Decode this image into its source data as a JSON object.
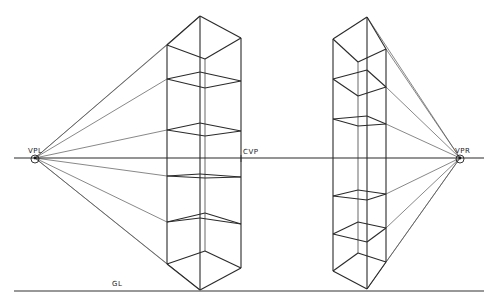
{
  "diagram": {
    "type": "two-point perspective construction",
    "labels": {
      "vpl": "VPL",
      "vpr": "VPR",
      "cvp": "CVP",
      "gl": "GL"
    },
    "colors": {
      "line": "#2a2a2a",
      "construction": "#555555",
      "background": "#ffffff"
    },
    "horizon_y": 158,
    "ground_line_y": 291,
    "vanishing_points": {
      "left": [
        35,
        158
      ],
      "right": [
        460,
        158
      ]
    },
    "cvp_x": 241,
    "left_tower": {
      "front_x": 200,
      "left_x": 167,
      "right_x": 241,
      "back_x": 205,
      "levels": [
        {
          "front": 16,
          "left": 45,
          "right": 38,
          "back": 59
        },
        {
          "front": 72,
          "left": 79,
          "right": 81,
          "back": 88
        },
        {
          "front": 123,
          "left": 130,
          "right": 131,
          "back": 136
        },
        {
          "front": 174,
          "left": 176,
          "right": 177,
          "back": 178
        },
        {
          "front": 218,
          "left": 222,
          "right": 224,
          "back": 213
        },
        {
          "front": 290,
          "left": 264,
          "right": 268,
          "back": 251
        }
      ]
    },
    "right_tower": {
      "front_x": 367,
      "left_x": 333,
      "right_x": 386,
      "back_x": 358,
      "levels": [
        {
          "front": 17,
          "left": 39,
          "right": 49,
          "back": 62
        },
        {
          "front": 70,
          "left": 79,
          "right": 87,
          "back": 96
        },
        {
          "front": 116,
          "left": 119,
          "right": 124,
          "back": 126
        },
        {
          "front": 200,
          "left": 196,
          "right": 194,
          "back": 190
        },
        {
          "front": 242,
          "left": 234,
          "right": 228,
          "back": 222
        },
        {
          "front": 289,
          "left": 271,
          "right": 262,
          "back": 253
        }
      ]
    }
  }
}
